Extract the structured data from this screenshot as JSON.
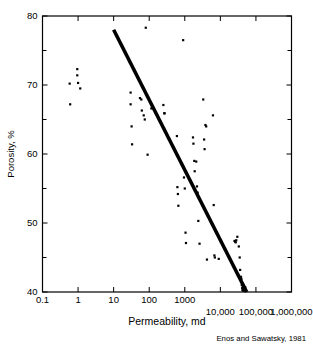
{
  "chart_data": {
    "type": "scatter",
    "title": "",
    "xlabel": "Permeability, md",
    "ylabel": "Porosity, %",
    "xscale": "log",
    "yscale": "linear",
    "xlim": [
      0.1,
      1000000
    ],
    "ylim": [
      40,
      80
    ],
    "grid": false,
    "legend": null,
    "annotation": "Enos and Sawatsky, 1981",
    "x_ticks": [
      {
        "value": 0.1,
        "label": "0.1",
        "row": "upper"
      },
      {
        "value": 1,
        "label": "1",
        "row": "upper"
      },
      {
        "value": 10,
        "label": "10",
        "row": "upper"
      },
      {
        "value": 100,
        "label": "100",
        "row": "upper"
      },
      {
        "value": 1000,
        "label": "1000",
        "row": "upper"
      },
      {
        "value": 10000,
        "label": "10,000",
        "row": "lower"
      },
      {
        "value": 100000,
        "label": "100,000",
        "row": "lower"
      },
      {
        "value": 1000000,
        "label": "1,000,000",
        "row": "lower"
      }
    ],
    "y_ticks": [
      {
        "value": 40,
        "label": "40",
        "major": true
      },
      {
        "value": 45,
        "label": "",
        "major": false
      },
      {
        "value": 50,
        "label": "50",
        "major": true
      },
      {
        "value": 55,
        "label": "",
        "major": false
      },
      {
        "value": 60,
        "label": "60",
        "major": true
      },
      {
        "value": 65,
        "label": "",
        "major": false
      },
      {
        "value": 70,
        "label": "70",
        "major": true
      },
      {
        "value": 75,
        "label": "",
        "major": false
      },
      {
        "value": 80,
        "label": "80",
        "major": true
      }
    ],
    "trend_line": {
      "x_start": 10,
      "y_start": 78.0,
      "x_end": 55000,
      "y_end": 40.0,
      "color": "#000000",
      "width": 3.6
    },
    "marker": {
      "shape": "square",
      "size": 2.2,
      "color": "#000000"
    },
    "points": [
      [
        0.58,
        70.2
      ],
      [
        0.6,
        67.2
      ],
      [
        0.95,
        72.3
      ],
      [
        0.95,
        71.4
      ],
      [
        1.0,
        70.3
      ],
      [
        1.15,
        69.5
      ],
      [
        30,
        68.9
      ],
      [
        30,
        67.2
      ],
      [
        32,
        64.0
      ],
      [
        33,
        61.4
      ],
      [
        55,
        68.1
      ],
      [
        60,
        67.9
      ],
      [
        62,
        66.3
      ],
      [
        70,
        65.6
      ],
      [
        75,
        65.0
      ],
      [
        80,
        78.3
      ],
      [
        90,
        59.9
      ],
      [
        115,
        66.6
      ],
      [
        250,
        67.1
      ],
      [
        265,
        65.9
      ],
      [
        270,
        65.9
      ],
      [
        600,
        62.6
      ],
      [
        620,
        55.2
      ],
      [
        640,
        54.2
      ],
      [
        660,
        52.5
      ],
      [
        900,
        76.5
      ],
      [
        950,
        56.6
      ],
      [
        1000,
        55.0
      ],
      [
        1050,
        48.6
      ],
      [
        1080,
        47.1
      ],
      [
        1700,
        62.4
      ],
      [
        1750,
        61.5
      ],
      [
        1850,
        59.0
      ],
      [
        1900,
        57.5
      ],
      [
        2100,
        58.9
      ],
      [
        2200,
        55.3
      ],
      [
        2300,
        54.4
      ],
      [
        2400,
        50.3
      ],
      [
        2600,
        47.0
      ],
      [
        3300,
        67.9
      ],
      [
        3500,
        62.1
      ],
      [
        3600,
        60.7
      ],
      [
        3800,
        64.2
      ],
      [
        4000,
        64.0
      ],
      [
        4200,
        44.7
      ],
      [
        6200,
        65.6
      ],
      [
        6500,
        52.6
      ],
      [
        6800,
        45.3
      ],
      [
        7000,
        45.0
      ],
      [
        9000,
        44.8
      ],
      [
        25000,
        47.4
      ],
      [
        26000,
        47.3
      ],
      [
        27000,
        47.2
      ],
      [
        28000,
        47.5
      ],
      [
        30000,
        48.0
      ],
      [
        33000,
        46.6
      ],
      [
        35000,
        45.0
      ],
      [
        36000,
        43.2
      ],
      [
        38000,
        42.2
      ],
      [
        39000,
        41.9
      ],
      [
        40000,
        41.0
      ],
      [
        41000,
        40.6
      ],
      [
        42000,
        40.3
      ],
      [
        43000,
        40.2
      ],
      [
        45000,
        41.0
      ],
      [
        46000,
        40.5
      ],
      [
        47000,
        40.2
      ],
      [
        50000,
        40.7
      ],
      [
        52000,
        40.3
      ]
    ]
  },
  "axis_titles": {
    "x": "Permeability, md",
    "y": "Porosity, %"
  },
  "credit": {
    "text": "Enos and Sawatsky, 1981"
  }
}
